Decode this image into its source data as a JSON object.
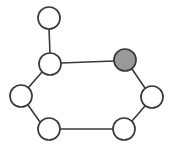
{
  "figure": {
    "width": 174,
    "height": 151,
    "background_color": "#ffffff"
  },
  "style": {
    "node_stroke_color": "#3a3a3a",
    "node_stroke_width": 1.7,
    "node_radius": 11,
    "edge_color": "#3a3a3a",
    "edge_width": 1.6,
    "fill_white": "#ffffff",
    "fill_gray": "#999999"
  },
  "graph_data": {
    "type": "node-link-diagram",
    "directed": false,
    "node_count": 7,
    "edge_count": 7,
    "nodes": [
      {
        "id": "n1",
        "label": "",
        "role": "pendant",
        "fill": "white",
        "cx": 49,
        "cy": 18,
        "r": 11
      },
      {
        "id": "n2",
        "label": "",
        "role": "ring-top-left",
        "fill": "white",
        "cx": 50,
        "cy": 64,
        "r": 11
      },
      {
        "id": "n3",
        "label": "",
        "role": "ring-top-right",
        "fill": "gray",
        "cx": 125,
        "cy": 60,
        "r": 11
      },
      {
        "id": "n4",
        "label": "",
        "role": "ring-right",
        "fill": "white",
        "cx": 152,
        "cy": 97,
        "r": 11
      },
      {
        "id": "n5",
        "label": "",
        "role": "ring-bottom-right",
        "fill": "white",
        "cx": 124,
        "cy": 129,
        "r": 11
      },
      {
        "id": "n6",
        "label": "",
        "role": "ring-bottom-left",
        "fill": "white",
        "cx": 49,
        "cy": 129,
        "r": 11
      },
      {
        "id": "n7",
        "label": "",
        "role": "ring-left",
        "fill": "white",
        "cx": 21,
        "cy": 96,
        "r": 11
      }
    ],
    "edges": [
      {
        "id": "e1",
        "source": "n1",
        "target": "n2",
        "x1": 49,
        "y1": 29,
        "x2": 50,
        "y2": 53
      },
      {
        "id": "e2",
        "source": "n2",
        "target": "n3",
        "x1": 61,
        "y1": 63,
        "x2": 114,
        "y2": 61
      },
      {
        "id": "e3",
        "source": "n3",
        "target": "n4",
        "x1": 132,
        "y1": 69,
        "x2": 145,
        "y2": 88
      },
      {
        "id": "e4",
        "source": "n4",
        "target": "n5",
        "x1": 145,
        "y1": 106,
        "x2": 132,
        "y2": 121
      },
      {
        "id": "e5",
        "source": "n5",
        "target": "n6",
        "x1": 113,
        "y1": 129,
        "x2": 60,
        "y2": 129
      },
      {
        "id": "e6",
        "source": "n6",
        "target": "n7",
        "x1": 40,
        "y1": 122,
        "x2": 28,
        "y2": 105
      },
      {
        "id": "e7",
        "source": "n7",
        "target": "n2",
        "x1": 28,
        "y1": 88,
        "x2": 42,
        "y2": 72
      }
    ]
  }
}
